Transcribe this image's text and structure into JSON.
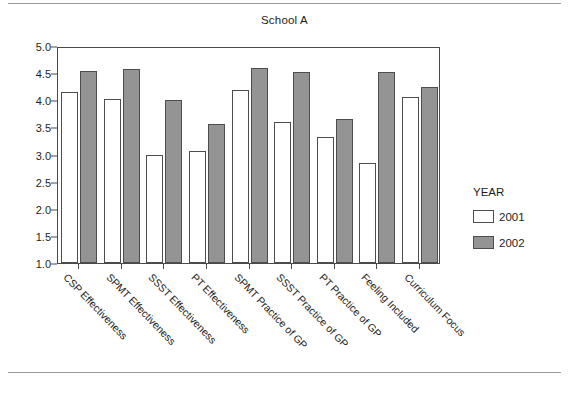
{
  "chart_data": {
    "type": "bar",
    "title": "School A",
    "xlabel": "",
    "ylabel": "",
    "ylim": [
      1.0,
      5.0
    ],
    "ytick_step": 0.5,
    "grid": false,
    "legend_position": "right",
    "legend_title": "YEAR",
    "categories": [
      "CSP Effectiveness",
      "SPMT Effectiveness",
      "SSST Effectiveness",
      "PT Effectiveness",
      "SPMT Practice of GP",
      "SSST Practice of GP",
      "PT Practice of GP",
      "Feeling Included",
      "Curriculum Focus"
    ],
    "ytick_labels": [
      "5.0",
      "4.5",
      "4.0",
      "3.5",
      "3.0",
      "2.5",
      "2.0",
      "1.5",
      "1.0"
    ],
    "ytick_values": [
      5.0,
      4.5,
      4.0,
      3.5,
      3.0,
      2.5,
      2.0,
      1.5,
      1.0
    ],
    "series": [
      {
        "name": "2001",
        "color": "#ffffff",
        "values": [
          4.15,
          4.02,
          3.0,
          3.07,
          4.19,
          3.6,
          3.33,
          2.85,
          4.06
        ]
      },
      {
        "name": "2002",
        "color": "#949494",
        "values": [
          4.54,
          4.58,
          4.0,
          3.56,
          4.59,
          4.52,
          3.65,
          4.53,
          4.25
        ]
      }
    ]
  }
}
